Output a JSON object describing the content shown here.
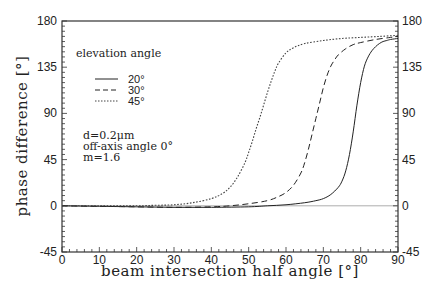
{
  "chart_data": {
    "type": "line",
    "title": "",
    "xlabel": "beam intersection half angle [°]",
    "ylabel": "phase difference [°]",
    "xlim": [
      0,
      90
    ],
    "ylim": [
      -45,
      180
    ],
    "xticks": [
      0,
      10,
      20,
      30,
      40,
      50,
      60,
      70,
      80,
      90
    ],
    "yticks": [
      -45,
      0,
      45,
      90,
      135,
      180
    ],
    "grid": false,
    "legend": {
      "title": "elevation angle",
      "position": "upper-left",
      "entries": [
        "20°",
        "30°",
        "45°"
      ]
    },
    "annotations": [
      "d=0.2μm",
      "off-axis angle 0°",
      "m=1.6"
    ],
    "series": [
      {
        "name": "20°",
        "style": "solid",
        "x": [
          0,
          10,
          20,
          30,
          40,
          50,
          55,
          60,
          65,
          68,
          70,
          72,
          74,
          75,
          76,
          77,
          78,
          79,
          80,
          81,
          82,
          83,
          84,
          85,
          86,
          87,
          88,
          90
        ],
        "y": [
          0,
          -0.5,
          -1,
          -1.5,
          -1.5,
          -1,
          0,
          1,
          3,
          5,
          7,
          11,
          18,
          24,
          34,
          50,
          72,
          98,
          120,
          136,
          145,
          151,
          155,
          158,
          160,
          161,
          162,
          163
        ]
      },
      {
        "name": "30°",
        "style": "dashed",
        "x": [
          0,
          10,
          20,
          30,
          40,
          45,
          50,
          55,
          58,
          60,
          62,
          64,
          65,
          66,
          67,
          68,
          69,
          70,
          71,
          72,
          73,
          74,
          76,
          78,
          80,
          84,
          88,
          90
        ],
        "y": [
          0,
          -0.5,
          -1,
          -1.5,
          -1,
          0,
          2,
          5,
          9,
          13,
          20,
          32,
          42,
          55,
          70,
          85,
          100,
          115,
          127,
          136,
          142,
          147,
          153,
          157,
          159,
          162,
          164,
          165
        ]
      },
      {
        "name": "45°",
        "style": "dotted",
        "x": [
          0,
          10,
          20,
          25,
          30,
          35,
          40,
          43,
          45,
          47,
          49,
          50,
          51,
          52,
          53,
          54,
          55,
          56,
          57,
          58,
          60,
          62,
          65,
          70,
          75,
          80,
          85,
          90
        ],
        "y": [
          0,
          0,
          0,
          0.5,
          1,
          3,
          7,
          12,
          18,
          28,
          42,
          52,
          63,
          75,
          86,
          98,
          110,
          121,
          131,
          139,
          149,
          154,
          158,
          161,
          163,
          164,
          165,
          166
        ]
      }
    ]
  }
}
